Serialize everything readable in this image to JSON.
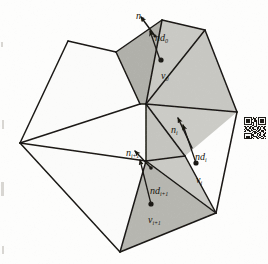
{
  "figure": {
    "type": "geometry-diagram",
    "background_color": "#fdfdfc",
    "line_color": "#1a1814",
    "fill_light": "#cfcfcb",
    "fill_mid": "#c3c3be",
    "fill_dark": "#b0b0aa",
    "fill_white": "#fbfbfa"
  },
  "labels": [
    {
      "id": "n0",
      "base": "n",
      "sub": "0",
      "x": 136,
      "y": 6,
      "name": "label-normal-0"
    },
    {
      "id": "nd0",
      "base": "nd",
      "sub": "0",
      "x": 155,
      "y": 28,
      "name": "label-normal-displacement-0"
    },
    {
      "id": "v0",
      "base": "v",
      "sub": "0",
      "x": 161,
      "y": 66,
      "name": "label-vertex-0"
    },
    {
      "id": "ni",
      "base": "n",
      "sub": "i",
      "x": 171,
      "y": 120,
      "name": "label-normal-i"
    },
    {
      "id": "ndi",
      "base": "nd",
      "sub": "i",
      "x": 195,
      "y": 147,
      "name": "label-normal-displacement-i"
    },
    {
      "id": "vi",
      "base": "v",
      "sub": "i",
      "x": 196,
      "y": 170,
      "name": "label-vertex-i"
    },
    {
      "id": "nip1",
      "base": "n",
      "sub": "i+1",
      "x": 126,
      "y": 143,
      "name": "label-normal-i-plus-1"
    },
    {
      "id": "ndip1",
      "base": "nd",
      "sub": "i+1",
      "x": 150,
      "y": 181,
      "name": "label-normal-displacement-i-plus-1"
    },
    {
      "id": "vip1",
      "base": "v",
      "sub": "i+1",
      "x": 148,
      "y": 210,
      "name": "label-vertex-i-plus-1"
    }
  ],
  "polygons": [
    {
      "name": "face-upper-left-white",
      "points": "20,143 68,41 116,52 140,104",
      "fill": "#fbfbfa"
    },
    {
      "name": "face-v0-dark",
      "points": "116,52 162,20 146,104 140,104",
      "fill": "#b0b0aa"
    },
    {
      "name": "face-top-right-light",
      "points": "162,20 205,30 146,104",
      "fill": "#c9c9c4"
    },
    {
      "name": "face-right-upper-light",
      "points": "205,30 237,112 146,104",
      "fill": "#c7c7c2"
    },
    {
      "name": "face-right-mid-light",
      "points": "146,104 237,112 185,156",
      "fill": "#cbcbc6"
    },
    {
      "name": "face-right-lower-light",
      "points": "146,104 185,156 146,161",
      "fill": "#c4c4bf"
    },
    {
      "name": "face-bottom-right-light",
      "points": "185,156 216,213 146,161",
      "fill": "#cacac5"
    },
    {
      "name": "face-vip1-dark",
      "points": "146,161 216,213 120,252",
      "fill": "#b6b6b0"
    },
    {
      "name": "face-lower-left-white",
      "points": "20,143 140,104 146,161 120,252",
      "fill": "#fbfbfa"
    }
  ],
  "mesh_edges": [
    {
      "name": "edge-hub-to-left",
      "from": [
        140,
        104
      ],
      "to": [
        20,
        143
      ]
    },
    {
      "name": "edge-left-to-topleft",
      "from": [
        20,
        143
      ],
      "to": [
        68,
        41
      ]
    },
    {
      "name": "edge-topleft-to-a",
      "from": [
        68,
        41
      ],
      "to": [
        116,
        52
      ]
    },
    {
      "name": "edge-a-to-apex",
      "from": [
        116,
        52
      ],
      "to": [
        162,
        20
      ]
    },
    {
      "name": "edge-apex-to-b",
      "from": [
        162,
        20
      ],
      "to": [
        205,
        30
      ]
    },
    {
      "name": "edge-b-to-right",
      "from": [
        205,
        30
      ],
      "to": [
        237,
        112
      ]
    },
    {
      "name": "edge-right-to-br",
      "from": [
        237,
        112
      ],
      "to": [
        216,
        213
      ]
    },
    {
      "name": "edge-br-to-bottom",
      "from": [
        216,
        213
      ],
      "to": [
        120,
        252
      ]
    },
    {
      "name": "edge-bottom-to-left",
      "from": [
        120,
        252
      ],
      "to": [
        20,
        143
      ]
    },
    {
      "name": "edge-a-to-hub",
      "from": [
        116,
        52
      ],
      "to": [
        140,
        104
      ]
    },
    {
      "name": "edge-apex-to-hub2",
      "from": [
        162,
        20
      ],
      "to": [
        146,
        104
      ]
    },
    {
      "name": "edge-hub-to-hub2",
      "from": [
        140,
        104
      ],
      "to": [
        146,
        104
      ]
    },
    {
      "name": "edge-hub2-to-b",
      "from": [
        146,
        104
      ],
      "to": [
        205,
        30
      ]
    },
    {
      "name": "edge-hub2-to-right",
      "from": [
        146,
        104
      ],
      "to": [
        237,
        112
      ]
    },
    {
      "name": "edge-hub2-to-mid",
      "from": [
        146,
        104
      ],
      "to": [
        185,
        156
      ]
    },
    {
      "name": "edge-hub2-to-lowhub",
      "from": [
        146,
        104
      ],
      "to": [
        146,
        161
      ]
    },
    {
      "name": "edge-mid-to-lowhub",
      "from": [
        185,
        156
      ],
      "to": [
        146,
        161
      ]
    },
    {
      "name": "edge-mid-to-br",
      "from": [
        185,
        156
      ],
      "to": [
        216,
        213
      ]
    },
    {
      "name": "edge-lowhub-to-br",
      "from": [
        146,
        161
      ],
      "to": [
        216,
        213
      ]
    },
    {
      "name": "edge-lowhub-to-bottom",
      "from": [
        146,
        161
      ],
      "to": [
        120,
        252
      ]
    },
    {
      "name": "edge-lowhub-to-left",
      "from": [
        146,
        161
      ],
      "to": [
        20,
        143
      ]
    }
  ],
  "vectors": [
    {
      "name": "vector-normal-0",
      "kind": "normal",
      "from": [
        155,
        36
      ],
      "to": [
        141,
        17
      ],
      "head": "arrow"
    },
    {
      "name": "vector-normal-displacement-0",
      "kind": "displacement",
      "from": [
        160,
        60
      ],
      "to": [
        150,
        31
      ],
      "head": "arrow"
    },
    {
      "name": "vector-normal-i",
      "kind": "normal",
      "from": [
        192,
        148
      ],
      "to": [
        178,
        118
      ],
      "head": "arrow"
    },
    {
      "name": "vector-normal-displacement-i",
      "kind": "displacement",
      "from": [
        196,
        163
      ],
      "to": [
        183,
        125
      ],
      "head": "arrow"
    },
    {
      "name": "vector-normal-i-plus-1",
      "kind": "normal",
      "from": [
        151,
        168
      ],
      "to": [
        135,
        151
      ],
      "head": "arrow"
    },
    {
      "name": "vector-normal-displacement-i-plus-1",
      "kind": "displacement",
      "from": [
        151,
        204
      ],
      "to": [
        140,
        160
      ],
      "head": "arrow"
    }
  ],
  "sample_points": [
    {
      "name": "point-v0",
      "x": 161,
      "y": 60,
      "r": 2.6
    },
    {
      "name": "point-vi",
      "x": 196,
      "y": 163,
      "r": 2.6
    },
    {
      "name": "point-vip1",
      "x": 151,
      "y": 204,
      "r": 2.6
    },
    {
      "name": "point-n0-tail",
      "x": 155,
      "y": 36,
      "r": 1.6
    },
    {
      "name": "point-nip1-tail",
      "x": 151,
      "y": 168,
      "r": 1.8
    }
  ],
  "artifacts": {
    "qr_code": {
      "name": "qr-code-artifact",
      "x": 244,
      "y": 117,
      "size": 22,
      "modules": [
        "1111111010101111111",
        "1000001011001000001",
        "1011101101001011101",
        "1011101001101011101",
        "1011101110101011101",
        "1000001010101000001",
        "1111111010101111111",
        "0000000110100000000",
        "1101011001101101011",
        "0110110110011010110",
        "1011001011010110011",
        "0101101100101101101",
        "1100110011011001100",
        "0000000101100110101",
        "1111111001011010011",
        "1000001110010110110",
        "1011101011101001011",
        "1011101100110110100",
        "1111111010011001101"
      ]
    },
    "scan_marks": [
      {
        "name": "scan-mark-left-upper",
        "x": 2,
        "y": 120,
        "w": 2,
        "h": 9
      },
      {
        "name": "scan-mark-left-mid",
        "x": 1,
        "y": 182,
        "w": 3,
        "h": 14
      },
      {
        "name": "scan-mark-left-lower",
        "x": 2,
        "y": 246,
        "w": 2,
        "h": 8
      },
      {
        "name": "scan-mark-left-top",
        "x": 1,
        "y": 42,
        "w": 2,
        "h": 5
      }
    ]
  }
}
